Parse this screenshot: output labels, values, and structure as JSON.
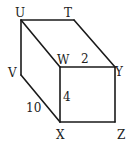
{
  "diagram": {
    "type": "rectangular-prism",
    "vertices": {
      "U": {
        "label": "U",
        "x": 21,
        "y": 20
      },
      "T": {
        "label": "T",
        "x": 74,
        "y": 20
      },
      "W": {
        "label": "W",
        "x": 60,
        "y": 67
      },
      "Y": {
        "label": "Y",
        "x": 115,
        "y": 67
      },
      "V": {
        "label": "V",
        "x": 21,
        "y": 75
      },
      "X": {
        "label": "X",
        "x": 60,
        "y": 122
      },
      "Z": {
        "label": "Z",
        "x": 115,
        "y": 122
      }
    },
    "edges": [
      [
        "U",
        "T"
      ],
      [
        "U",
        "W"
      ],
      [
        "U",
        "V"
      ],
      [
        "T",
        "Y"
      ],
      [
        "W",
        "Y"
      ],
      [
        "W",
        "X"
      ],
      [
        "V",
        "X"
      ],
      [
        "Y",
        "Z"
      ],
      [
        "X",
        "Z"
      ]
    ],
    "measurements": {
      "WY": "2",
      "WX": "4",
      "VX": "10"
    }
  }
}
